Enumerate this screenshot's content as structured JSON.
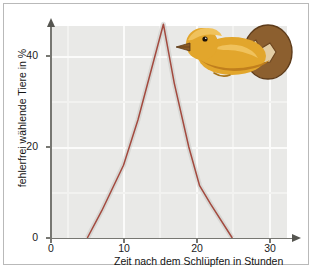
{
  "chart_data": {
    "type": "line",
    "title": "",
    "xlabel": "Zeit nach dem Schlüpfen in Stunden",
    "ylabel": "fehlerfrei wählende Tiere in %",
    "xlim": [
      0,
      34
    ],
    "ylim": [
      0,
      48
    ],
    "xticks": [
      0,
      10,
      20,
      30
    ],
    "xtick_labels": [
      "0",
      "10",
      "20",
      "30"
    ],
    "yticks": [
      0,
      20,
      40
    ],
    "ytick_labels": [
      "0",
      "20",
      "40"
    ],
    "grid": true,
    "legend": null,
    "series": [
      {
        "name": "fehlerfrei wählende Tiere",
        "color": "#a34a3f",
        "x": [
          5,
          7,
          10,
          12,
          15.5,
          17,
          19,
          20.5,
          22,
          25
        ],
        "y": [
          0,
          6,
          16,
          26,
          47,
          34,
          20,
          11.5,
          7.5,
          0
        ]
      }
    ],
    "annotations": [
      {
        "name": "chick-hatching-illustration",
        "description": "Küken schlüpft aus Ei",
        "x": 17,
        "y": 42
      }
    ]
  },
  "axes": {
    "y_title": "fehlerfrei wählende Tiere in %",
    "x_title": "Zeit nach dem Schlüpfen in Stunden",
    "y_tick_0": "0",
    "y_tick_20": "20",
    "y_tick_40": "40",
    "x_tick_0": "0",
    "x_tick_10": "10",
    "x_tick_20": "20",
    "x_tick_30": "30"
  },
  "colors": {
    "curve": "#a34a3f",
    "plot_background": "#e9e9e7",
    "grid": "#fbfbfa",
    "axis": "#777772",
    "frame": "#b9b9b9",
    "chick_body": "#e2a62c",
    "chick_body_dark": "#c07f1d",
    "chick_beak": "#8a5a22",
    "egg_shell": "#8c5f2f",
    "egg_shell_dark": "#6d4620",
    "egg_inner": "#e8d2a8"
  }
}
